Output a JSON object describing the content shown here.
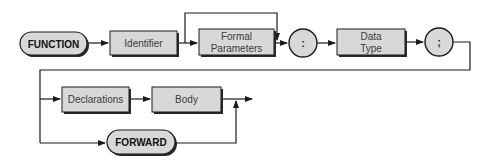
{
  "diagram": {
    "title": "",
    "type": "syntax-diagram",
    "nodes": {
      "function_kw": "FUNCTION",
      "identifier": "Identifier",
      "formal_params_line1": "Formal",
      "formal_params_line2": "Parameters",
      "colon": ":",
      "data_type_line1": "Data",
      "data_type_line2": "Type",
      "semicolon": ";",
      "declarations": "Declarations",
      "body": "Body",
      "forward_kw": "FORWARD"
    },
    "colors": {
      "box_fill": "#d8d8d8",
      "stroke": "#1a1a1a",
      "shadow": "#2a2a2a"
    },
    "edges": [
      {
        "from": "FUNCTION",
        "to": "Identifier"
      },
      {
        "from": "Identifier",
        "to": "Formal Parameters"
      },
      {
        "from": "Identifier",
        "to": ":",
        "note": "bypass over Formal Parameters"
      },
      {
        "from": "Formal Parameters",
        "to": ":"
      },
      {
        "from": ":",
        "to": "Data Type"
      },
      {
        "from": "Data Type",
        "to": ";"
      },
      {
        "from": ";",
        "to": "Declarations"
      },
      {
        "from": ";",
        "to": "FORWARD"
      },
      {
        "from": "Declarations",
        "to": "Body"
      },
      {
        "from": "Body",
        "to": "exit"
      },
      {
        "from": "FORWARD",
        "to": "exit"
      }
    ]
  }
}
